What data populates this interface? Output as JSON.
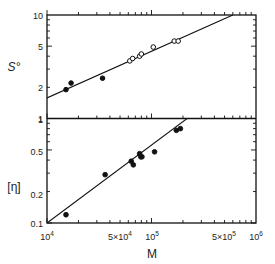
{
  "chart_data": [
    {
      "type": "scatter",
      "panel": "upper",
      "title": "",
      "xlabel": "M",
      "ylabel": "S°",
      "xscale": "log",
      "yscale": "log",
      "xlim": [
        10000,
        1000000
      ],
      "ylim": [
        1,
        10
      ],
      "y_ticks": [
        "10",
        "5",
        "2",
        "1"
      ],
      "grid": false,
      "series": [
        {
          "name": "filled",
          "marker": "filled-circle",
          "points": [
            [
              15200,
              1.9
            ],
            [
              17000,
              2.2
            ],
            [
              34000,
              2.45
            ]
          ]
        },
        {
          "name": "open",
          "marker": "open-circle",
          "points": [
            [
              62000,
              3.6
            ],
            [
              66000,
              3.8
            ],
            [
              77000,
              4.0
            ],
            [
              80000,
              4.2
            ],
            [
              104000,
              4.9
            ],
            [
              165000,
              5.6
            ],
            [
              180000,
              5.6
            ]
          ]
        }
      ],
      "fit_line": {
        "x": [
          10000,
          600000
        ],
        "y": [
          1.58,
          10
        ]
      }
    },
    {
      "type": "scatter",
      "panel": "lower",
      "title": "",
      "xlabel": "M",
      "ylabel": "[η]",
      "xscale": "log",
      "yscale": "log",
      "xlim": [
        10000,
        1000000
      ],
      "ylim": [
        0.1,
        1
      ],
      "y_ticks": [
        "1",
        "0.5",
        "0.2",
        "0.1"
      ],
      "x_ticks": [
        "10⁴",
        "5×10⁴",
        "10⁵",
        "5×10⁵",
        "10⁶"
      ],
      "grid": false,
      "series": [
        {
          "name": "filled",
          "marker": "filled-circle",
          "points": [
            [
              15200,
              0.12
            ],
            [
              36000,
              0.29
            ],
            [
              64000,
              0.39
            ],
            [
              67000,
              0.36
            ],
            [
              77000,
              0.46
            ],
            [
              79000,
              0.43
            ],
            [
              81000,
              0.43
            ],
            [
              107000,
              0.48
            ],
            [
              173000,
              0.77
            ],
            [
              189000,
              0.8
            ]
          ]
        }
      ],
      "fit_line": {
        "x": [
          10000,
          1000000
        ],
        "y": [
          0.1,
          3.1
        ]
      }
    }
  ],
  "axes": {
    "upper": {
      "ylabel": "S°",
      "yticks": [
        {
          "label": "10",
          "y": 15
        },
        {
          "label": "5",
          "y": 46
        },
        {
          "label": "2",
          "y": 87
        },
        {
          "label": "1",
          "y": 118
        }
      ]
    },
    "lower": {
      "ylabel": "[η]",
      "yticks": [
        {
          "label": "1",
          "y": 119
        },
        {
          "label": "0.5",
          "y": 151
        },
        {
          "label": "0.2",
          "y": 194
        },
        {
          "label": "0.1",
          "y": 223
        }
      ]
    },
    "x": {
      "label": "M",
      "ticks": [
        {
          "label": "10",
          "sup": "4",
          "x": 47
        },
        {
          "label": "5×10",
          "sup": "4",
          "x": 120
        },
        {
          "label": "10",
          "sup": "5",
          "x": 152
        },
        {
          "label": "5×10",
          "sup": "5",
          "x": 224
        },
        {
          "label": "10",
          "sup": "6",
          "x": 256
        }
      ]
    }
  }
}
